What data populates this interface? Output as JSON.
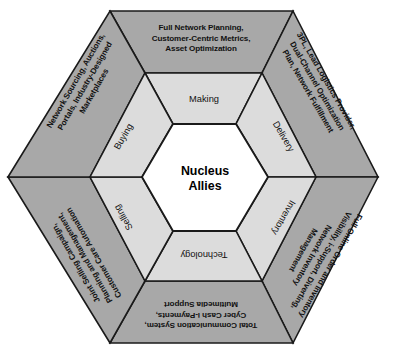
{
  "diagram": {
    "core": {
      "line1": "Nucleus",
      "line2": "Allies"
    },
    "colors": {
      "outer_ring": "#a8a8a8",
      "middle_ring": "#dcdcdc",
      "core": "#ffffff",
      "stroke": "#1a1a1a",
      "text": "#111111"
    },
    "middle_ring": [
      {
        "id": "making",
        "label": "Making",
        "position": "top"
      },
      {
        "id": "delivery",
        "label": "Delivery",
        "position": "upper-right"
      },
      {
        "id": "inventory",
        "label": "Inventory",
        "position": "lower-right"
      },
      {
        "id": "technology",
        "label": "Technology",
        "position": "bottom"
      },
      {
        "id": "selling",
        "label": "Selling",
        "position": "lower-left"
      },
      {
        "id": "buying",
        "label": "Buying",
        "position": "upper-left"
      }
    ],
    "outer_ring": [
      {
        "id": "planning",
        "position": "top",
        "lines": [
          "Full Network Planning,",
          "Customer-Centric Metrics,",
          "Asset Optimization"
        ]
      },
      {
        "id": "logistics",
        "position": "upper-right",
        "lines": [
          "3PL, Lead Logistics Provider,",
          "Dual-Channel Optimization",
          "Plan, Network Fulfillment"
        ]
      },
      {
        "id": "visibility",
        "position": "lower-right",
        "lines": [
          "Full Online Order and Inventory",
          "Visibility, i-Support, Diverting,",
          "Network Inventory",
          "Management"
        ]
      },
      {
        "id": "communication",
        "position": "bottom",
        "lines": [
          "Total Communication System,",
          "Cyber Cash i-Payments,",
          "Multimedia Support"
        ]
      },
      {
        "id": "campaign",
        "position": "lower-left",
        "lines": [
          "Joint Selling Campaign,",
          "Planning and Management,",
          "Customer Care Automation"
        ]
      },
      {
        "id": "sourcing",
        "position": "upper-left",
        "lines": [
          "Network Sourcing, Auctions,",
          "Portals, Industry-Designed",
          "Marketplaces"
        ]
      }
    ]
  }
}
